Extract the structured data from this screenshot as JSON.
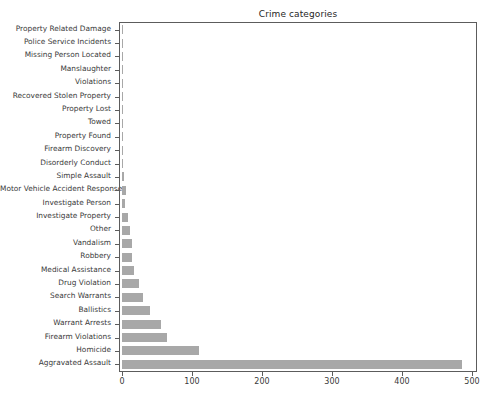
{
  "chart_data": {
    "type": "bar",
    "orientation": "horizontal",
    "title": "Crime categories",
    "xlabel": "",
    "ylabel": "",
    "xlim": [
      0,
      510
    ],
    "grid": false,
    "legend": null,
    "bar_color": "#a8a8a8",
    "axis_color": "#5c5c5c",
    "xticks": [
      0,
      100,
      200,
      300,
      400,
      500
    ],
    "xtick_labels": [
      "0",
      "100",
      "200",
      "300",
      "400",
      "500"
    ],
    "categories": [
      "Property Related Damage",
      "Police Service Incidents",
      "Missing Person Located",
      "Manslaughter",
      "Violations",
      "Recovered Stolen Property",
      "Property Lost",
      "Towed",
      "Property Found",
      "Firearm Discovery",
      "Disorderly Conduct",
      "Simple Assault",
      "Motor Vehicle Accident Response",
      "Investigate Person",
      "Investigate Property",
      "Other",
      "Vandalism",
      "Robbery",
      "Medical Assistance",
      "Drug Violation",
      "Search Warrants",
      "Ballistics",
      "Warrant Arrests",
      "Firearm Violations",
      "Homicide",
      "Aggravated Assault"
    ],
    "values": [
      1,
      1,
      1,
      1,
      1,
      1,
      1,
      2,
      2,
      2,
      2,
      3,
      5,
      4,
      9,
      11,
      14,
      14,
      17,
      24,
      30,
      40,
      55,
      64,
      110,
      485
    ]
  }
}
